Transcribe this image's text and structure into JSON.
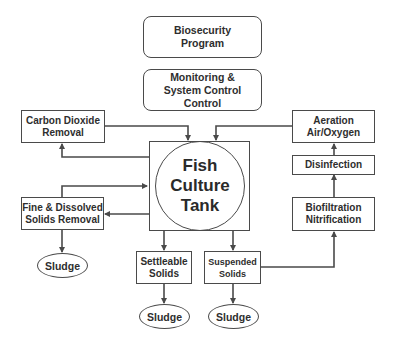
{
  "diagram": {
    "top_boxes": {
      "biosecurity": "Biosecurity\nProgram",
      "monitoring": "Monitoring &\nSystem Control Control"
    },
    "left_boxes": {
      "carbon_dioxide": "Carbon Dioxide\nRemoval",
      "fine_solids": "Fine & Dissolved\nSolids Removal"
    },
    "center": {
      "tank": "Fish Culture\nTank"
    },
    "bottom_boxes": {
      "settleable": "Settleable\nSolids",
      "suspended": "Suspended\nSolids"
    },
    "right_boxes": {
      "aeration": "Aeration\nAir/Oxygen",
      "disinfection": "Disinfection",
      "biofiltration": "Biofiltration\nNitrification"
    },
    "sludge": {
      "left": "Sludge",
      "settleable": "Sludge",
      "suspended": "Sludge"
    },
    "colors": {
      "stroke": "#4a4a4a",
      "text": "#2e2e2e",
      "background": "#ffffff"
    }
  }
}
